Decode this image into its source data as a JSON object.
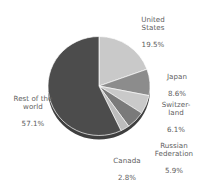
{
  "chart_data": {
    "type": "pie",
    "title": "",
    "subtitle": "",
    "xlabel": "",
    "ylabel": "",
    "legend_position": "none",
    "grid": false,
    "labels_inside": false,
    "unit": "%",
    "categories": [
      "United States",
      "Japan",
      "Switzerland",
      "Russian Federation",
      "Canada",
      "Rest of the world"
    ],
    "values": [
      19.5,
      8.6,
      6.1,
      5.9,
      2.8,
      57.1
    ],
    "slices": [
      {
        "name": "United States",
        "label_lines": "United\nStates",
        "value": 19.5,
        "value_text": "19.5%",
        "color": "#c9c9c9",
        "start_angle": 0,
        "end_angle": 70.2
      },
      {
        "name": "Japan",
        "label_lines": "Japan",
        "value": 8.6,
        "value_text": "8.6%",
        "color": "#8c8c8c",
        "start_angle": 70.2,
        "end_angle": 101.2
      },
      {
        "name": "Switzerland",
        "label_lines": "Switzer-\nland",
        "value": 6.1,
        "value_text": "6.1%",
        "color": "#c9c9c9",
        "start_angle": 101.2,
        "end_angle": 123.2
      },
      {
        "name": "Russian Federation",
        "label_lines": "Russian\nFederation",
        "value": 5.9,
        "value_text": "5.9%",
        "color": "#7a7a7a",
        "start_angle": 123.2,
        "end_angle": 144.4
      },
      {
        "name": "Canada",
        "label_lines": "Canada",
        "value": 2.8,
        "value_text": "2.8%",
        "color": "#bdbdbd",
        "start_angle": 144.4,
        "end_angle": 154.5
      },
      {
        "name": "Rest of the world",
        "label_lines": "Rest of the\nworld",
        "value": 57.1,
        "value_text": "57.1%",
        "color": "#4c4c4c",
        "start_angle": 154.5,
        "end_angle": 360
      }
    ],
    "colors": {
      "background": "#ffffff",
      "label_text": "#5e5e5e",
      "pie_rim": "#3f3f3f"
    }
  }
}
